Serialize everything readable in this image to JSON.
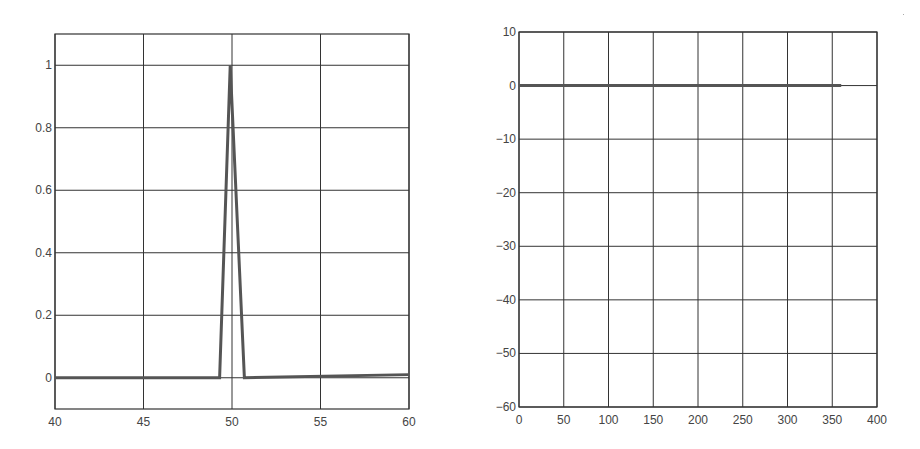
{
  "chart_data": [
    {
      "type": "line",
      "title": "",
      "xlabel": "",
      "ylabel": "",
      "xlim": [
        40,
        60
      ],
      "ylim": [
        -0.1,
        1.1
      ],
      "grid": true,
      "legend": null,
      "x_ticks": [
        "40",
        "45",
        "50",
        "55",
        "60"
      ],
      "y_ticks": [
        "0",
        "0.2",
        "0.4",
        "0.6",
        "0.8",
        "1"
      ],
      "series": [
        {
          "name": "pulse",
          "x": [
            40,
            49.3,
            49.9,
            50.7,
            60
          ],
          "y": [
            0,
            0,
            1,
            0,
            0.01
          ]
        }
      ]
    },
    {
      "type": "line",
      "title": "",
      "xlabel": "",
      "ylabel": "",
      "xlim": [
        0,
        400
      ],
      "ylim": [
        -60,
        10
      ],
      "grid": true,
      "legend": null,
      "x_ticks": [
        "0",
        "50",
        "100",
        "150",
        "200",
        "250",
        "300",
        "350",
        "400"
      ],
      "y_ticks": [
        "10",
        "0",
        "-10",
        "-20",
        "-30",
        "-40",
        "-50",
        "-60"
      ],
      "series": [
        {
          "name": "flat-response",
          "x": [
            0,
            360
          ],
          "y": [
            0,
            0
          ]
        }
      ]
    }
  ],
  "colors": {
    "line": "#555555",
    "grid": "#333333",
    "text": "#444444"
  }
}
